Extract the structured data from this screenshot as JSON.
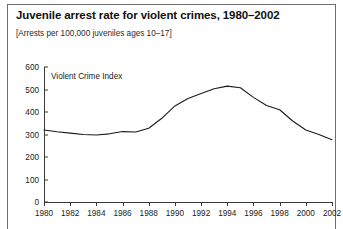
{
  "header": {
    "title": "Juvenile arrest rate for violent crimes, 1980–2002",
    "subtitle": "[Arrests per 100,000 juveniles ages 10–17]"
  },
  "chart_data": {
    "type": "line",
    "title": "Juvenile arrest rate for violent crimes, 1980–2002",
    "subtitle": "[Arrests per 100,000 juveniles ages 10–17]",
    "series_label": "Violent Crime Index",
    "xlabel": "",
    "ylabel": "",
    "ylim": [
      0,
      600
    ],
    "ytick_step": 100,
    "yticks": [
      0,
      100,
      200,
      300,
      400,
      500,
      600
    ],
    "ytick_labels": [
      "0",
      "100",
      "200",
      "300",
      "400",
      "500",
      "600"
    ],
    "xlim": [
      1980,
      2002
    ],
    "xtick_step": 2,
    "xticks": [
      1980,
      1982,
      1984,
      1986,
      1988,
      1990,
      1992,
      1994,
      1996,
      1998,
      2000,
      2002
    ],
    "xtick_labels": [
      "1980",
      "1982",
      "1984",
      "1986",
      "1988",
      "1990",
      "1992",
      "1994",
      "1996",
      "1998",
      "2000",
      "2002"
    ],
    "grid": false,
    "legend": "inside-plot-label",
    "line_color": "#1a1a1a",
    "x": [
      1980,
      1981,
      1982,
      1983,
      1984,
      1985,
      1986,
      1987,
      1988,
      1989,
      1990,
      1991,
      1992,
      1993,
      1994,
      1995,
      1996,
      1997,
      1998,
      1999,
      2000,
      2001,
      2002
    ],
    "series": [
      {
        "name": "Violent Crime Index",
        "values": [
          320,
          312,
          306,
          300,
          298,
          303,
          313,
          311,
          328,
          372,
          427,
          460,
          482,
          503,
          515,
          508,
          465,
          429,
          410,
          360,
          320,
          300,
          277
        ]
      }
    ]
  }
}
